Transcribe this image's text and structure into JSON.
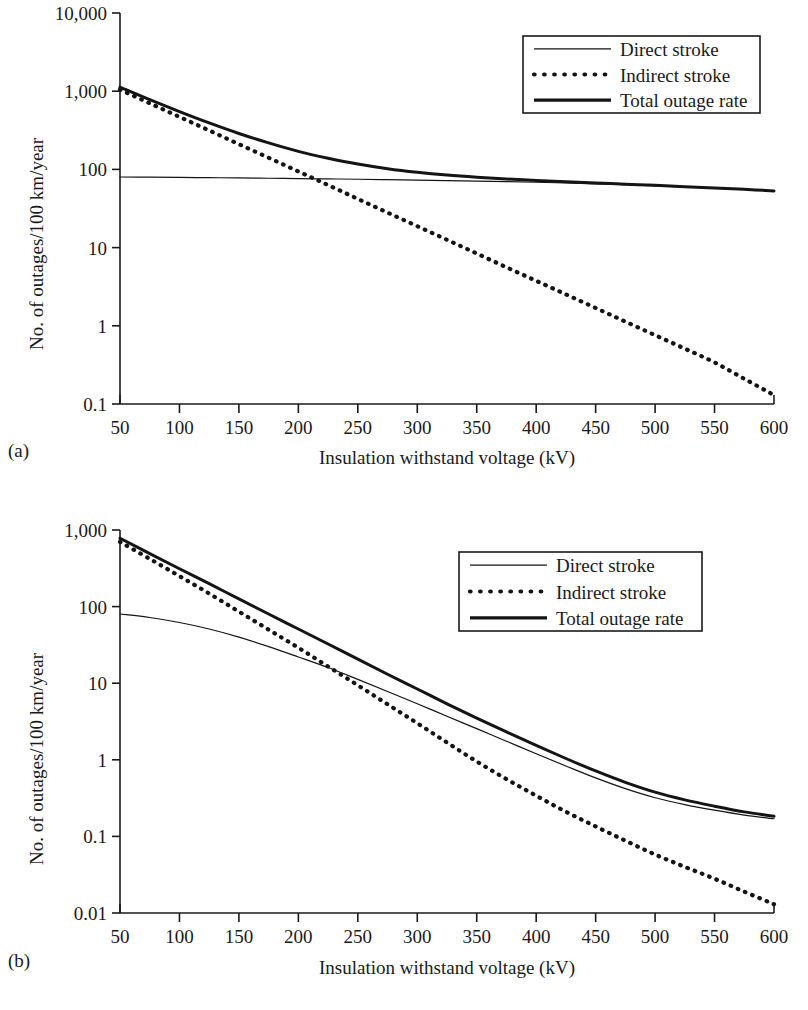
{
  "figure": {
    "panels": [
      {
        "letter": "(a)",
        "xlabel": "Insulation withstand voltage (kV)",
        "ylabel": "No. of outages/100 km/year",
        "xticks": [
          "50",
          "100",
          "150",
          "200",
          "250",
          "300",
          "350",
          "400",
          "450",
          "500",
          "550",
          "600"
        ],
        "yticks": [
          "10,000",
          "1,000",
          "100",
          "10",
          "1",
          "0.1"
        ],
        "legend": [
          "Direct stroke",
          "Indirect stroke",
          "Total outage rate"
        ]
      },
      {
        "letter": "(b)",
        "xlabel": "Insulation withstand voltage (kV)",
        "ylabel": "No. of outages/100 km/year",
        "xticks": [
          "50",
          "100",
          "150",
          "200",
          "250",
          "300",
          "350",
          "400",
          "450",
          "500",
          "550",
          "600"
        ],
        "yticks": [
          "1,000",
          "100",
          "10",
          "1",
          "0.1",
          "0.01"
        ],
        "legend": [
          "Direct stroke",
          "Indirect stroke",
          "Total outage rate"
        ]
      }
    ]
  },
  "chart_data": [
    {
      "type": "line",
      "panel": "(a)",
      "title": "",
      "xlabel": "Insulation withstand voltage (kV)",
      "ylabel": "No. of outages/100 km/year",
      "xlim": [
        50,
        600
      ],
      "ylim": [
        0.1,
        10000
      ],
      "yscale": "log",
      "xscale": "linear",
      "grid": false,
      "legend_position": "top-right",
      "x": [
        50,
        75,
        100,
        125,
        150,
        175,
        200,
        225,
        250,
        275,
        300,
        325,
        350,
        375,
        400,
        425,
        450,
        475,
        500,
        525,
        550,
        575,
        600
      ],
      "series": [
        {
          "name": "Direct stroke",
          "style": "thin-solid",
          "values": [
            80,
            79.5,
            79,
            78.4,
            77.8,
            77.1,
            76.4,
            75.6,
            74.8,
            73.9,
            73,
            72,
            71,
            69.8,
            68.5,
            67,
            65.4,
            63.6,
            61.7,
            59.7,
            57.6,
            55.4,
            53.0
          ]
        },
        {
          "name": "Indirect stroke",
          "style": "dotted",
          "values": [
            1050,
            700,
            470,
            315,
            210,
            141,
            94,
            63,
            42,
            28,
            18.8,
            12.6,
            8.4,
            5.6,
            3.76,
            2.52,
            1.69,
            1.13,
            0.76,
            0.51,
            0.34,
            0.21,
            0.13
          ]
        },
        {
          "name": "Total outage rate",
          "style": "thick-solid",
          "values": [
            1130,
            779,
            549,
            393,
            288,
            218,
            170,
            139,
            117,
            102,
            91.8,
            84.6,
            79.4,
            75.4,
            72.3,
            69.5,
            67.1,
            64.7,
            62.5,
            60.2,
            57.9,
            55.6,
            53.1
          ]
        }
      ]
    },
    {
      "type": "line",
      "panel": "(b)",
      "title": "",
      "xlabel": "Insulation withstand voltage (kV)",
      "ylabel": "No. of outages/100 km/year",
      "xlim": [
        50,
        600
      ],
      "ylim": [
        0.01,
        1000
      ],
      "yscale": "log",
      "xscale": "linear",
      "grid": false,
      "legend_position": "top-right",
      "x": [
        50,
        75,
        100,
        125,
        150,
        175,
        200,
        225,
        250,
        275,
        300,
        325,
        350,
        375,
        400,
        425,
        450,
        475,
        500,
        525,
        550,
        575,
        600
      ],
      "series": [
        {
          "name": "Direct stroke",
          "style": "thin-solid",
          "values": [
            80,
            72,
            62,
            51,
            40,
            30,
            22,
            16,
            11.2,
            7.8,
            5.4,
            3.7,
            2.55,
            1.75,
            1.2,
            0.83,
            0.58,
            0.42,
            0.32,
            0.26,
            0.22,
            0.19,
            0.17
          ]
        },
        {
          "name": "Indirect stroke",
          "style": "dotted",
          "values": [
            700,
            420,
            250,
            148,
            86,
            50,
            29,
            16.5,
            9.4,
            5.3,
            3.0,
            1.68,
            0.95,
            0.56,
            0.34,
            0.21,
            0.135,
            0.088,
            0.058,
            0.04,
            0.028,
            0.019,
            0.013
          ]
        },
        {
          "name": "Total outage rate",
          "style": "thick-solid",
          "values": [
            780,
            492,
            312,
            199,
            126,
            80,
            51,
            32.5,
            20.6,
            13.1,
            8.4,
            5.38,
            3.5,
            2.31,
            1.54,
            1.04,
            0.715,
            0.508,
            0.378,
            0.3,
            0.248,
            0.209,
            0.183
          ]
        }
      ]
    }
  ]
}
